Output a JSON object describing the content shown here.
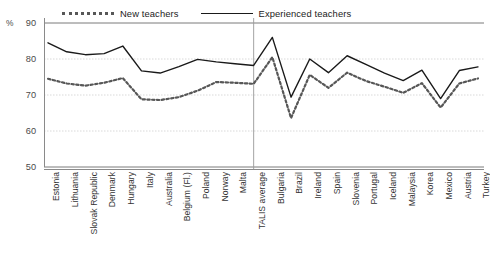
{
  "legend": {
    "position": "top-left",
    "items": [
      {
        "label": "New teachers",
        "style": "dashed",
        "color": "#575757",
        "icon": "dashed-line-icon"
      },
      {
        "label": "Experienced teachers",
        "style": "solid",
        "color": "#1a1a1a",
        "icon": "solid-line-icon"
      }
    ]
  },
  "axes": {
    "unit": "%",
    "y_ticks": [
      "90",
      "80",
      "70",
      "60",
      "50"
    ],
    "ylim": [
      50,
      90
    ],
    "grid": true
  },
  "chart_data": {
    "type": "line",
    "title": "",
    "subtitle": "",
    "xlabel": "",
    "ylabel": "%",
    "ylim": [
      50,
      90
    ],
    "yticks": [
      50,
      60,
      70,
      80,
      90
    ],
    "grid": true,
    "legend_position": "top-left",
    "annotations": [
      {
        "type": "vertical-divider",
        "at_category": "TALIS average"
      }
    ],
    "categories": [
      "Estonia",
      "Lithuania",
      "Slovak Republic",
      "Denmark",
      "Hungary",
      "Italy",
      "Australia",
      "Belgium (Fl.)",
      "Poland",
      "Norway",
      "Malta",
      "TALIS average",
      "Bulgaria",
      "Brazil",
      "Ireland",
      "Spain",
      "Slovenia",
      "Portugal",
      "Iceland",
      "Malaysia",
      "Korea",
      "Mexico",
      "Austria",
      "Turkey"
    ],
    "series": [
      {
        "name": "New teachers",
        "style": "dashed",
        "color": "#575757",
        "values": [
          74.5,
          73.2,
          72.6,
          73.4,
          74.7,
          68.8,
          68.6,
          69.4,
          71.2,
          73.6,
          73.4,
          73.1,
          80.5,
          63.6,
          75.6,
          72.0,
          76.2,
          73.9,
          72.3,
          70.6,
          73.3,
          66.5,
          73.2,
          74.6
        ]
      },
      {
        "name": "Experienced teachers",
        "style": "solid",
        "color": "#1a1a1a",
        "values": [
          84.5,
          82.0,
          81.2,
          81.5,
          83.6,
          76.7,
          76.1,
          77.9,
          79.9,
          79.2,
          78.7,
          78.2,
          86.0,
          69.4,
          80.0,
          76.2,
          80.9,
          78.5,
          76.1,
          74.0,
          76.9,
          69.0,
          76.8,
          77.8
        ]
      }
    ]
  }
}
